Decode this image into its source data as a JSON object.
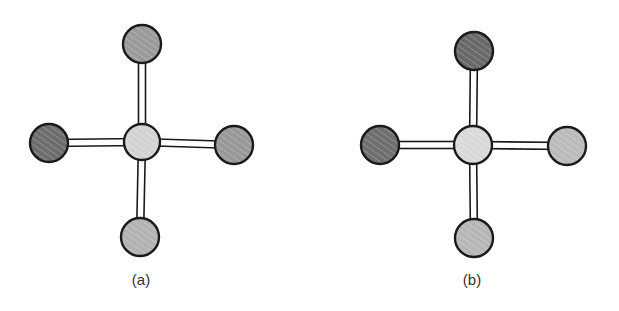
{
  "figure": {
    "panels": [
      {
        "label": "(a)",
        "label_pos": {
          "x": 141,
          "y": 271
        },
        "center_atom": {
          "x": 142,
          "y": 142,
          "r": 18,
          "fill": "#d6d6d6",
          "shade": "light"
        },
        "ligands": [
          {
            "position": "top",
            "x": 142,
            "y": 44,
            "r": 19,
            "fill": "#9c9c9c",
            "shade": "medium"
          },
          {
            "position": "left",
            "x": 49,
            "y": 143,
            "r": 19,
            "fill": "#6e6e6e",
            "shade": "dark"
          },
          {
            "position": "right",
            "x": 234,
            "y": 145,
            "r": 19,
            "fill": "#9a9a9a",
            "shade": "medium"
          },
          {
            "position": "bottom",
            "x": 140,
            "y": 237,
            "r": 19,
            "fill": "#b4b4b4",
            "shade": "medium-light"
          }
        ]
      },
      {
        "label": "(b)",
        "label_pos": {
          "x": 472,
          "y": 271
        },
        "center_atom": {
          "x": 473,
          "y": 145,
          "r": 19,
          "fill": "#dcdcdc",
          "shade": "light"
        },
        "ligands": [
          {
            "position": "top",
            "x": 474,
            "y": 51,
            "r": 19,
            "fill": "#6a6a6a",
            "shade": "dark"
          },
          {
            "position": "left",
            "x": 380,
            "y": 145,
            "r": 19,
            "fill": "#707070",
            "shade": "dark"
          },
          {
            "position": "right",
            "x": 567,
            "y": 146,
            "r": 19,
            "fill": "#bdbdbd",
            "shade": "light"
          },
          {
            "position": "bottom",
            "x": 474,
            "y": 238,
            "r": 19,
            "fill": "#b8b8b8",
            "shade": "light"
          }
        ]
      }
    ],
    "colors": {
      "outline": "#1a1a1a",
      "bond_fill": "#ffffff",
      "background": "#ffffff"
    }
  }
}
